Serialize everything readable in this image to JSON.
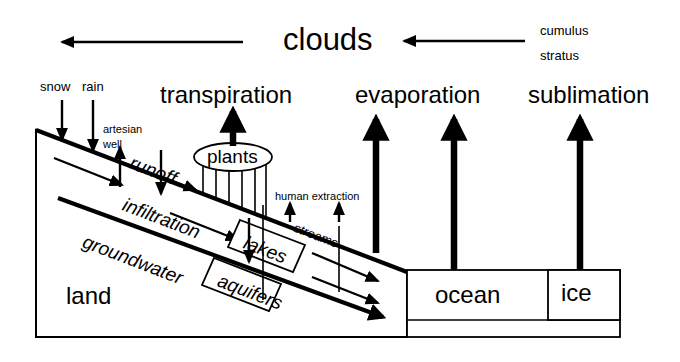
{
  "diagram": {
    "title_text": "clouds",
    "top_labels": {
      "clouds": "clouds",
      "cumulus": "cumulus",
      "stratus": "stratus"
    },
    "process_labels": {
      "snow": "snow",
      "rain": "rain",
      "transpiration": "transpiration",
      "evaporation": "evaporation",
      "sublimation": "sublimation",
      "artesian": "artesian",
      "well": "well",
      "runoff": "runoff",
      "infiltration": "infiltration",
      "groundwater": "groundwater",
      "human_extraction": "human extraction",
      "streams": "streams"
    },
    "reservoir_labels": {
      "plants": "plants",
      "lakes": "lakes",
      "aquifers": "aquifers",
      "land": "land",
      "ocean": "ocean",
      "ice": "ice"
    },
    "colors": {
      "ink": "#000000",
      "background": "#ffffff"
    }
  }
}
